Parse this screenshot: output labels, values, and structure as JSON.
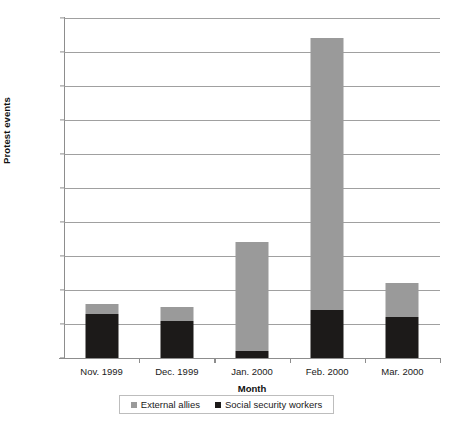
{
  "chart_data": {
    "type": "bar",
    "subtype": "stacked-vertical",
    "title": "",
    "xlabel": "Month",
    "ylabel": "Protest events",
    "categories": [
      "Nov. 1999",
      "Dec. 1999",
      "Jan. 2000",
      "Feb. 2000",
      "Mar. 2000"
    ],
    "series": [
      {
        "name": "Social security workers",
        "color": "#1c1a19",
        "values": [
          13,
          11,
          2,
          14,
          12
        ]
      },
      {
        "name": "External allies",
        "color": "#9a9a9a",
        "values": [
          3,
          4,
          32,
          80,
          10
        ]
      }
    ],
    "totals": [
      16,
      15,
      34,
      94,
      22
    ],
    "ylim": [
      0,
      100
    ],
    "ytick_labels": [
      "0",
      "10",
      "20",
      "30",
      "40",
      "50",
      "60",
      "70",
      "80",
      "90",
      "100"
    ],
    "ytick_values": [
      0,
      10,
      20,
      30,
      40,
      50,
      60,
      70,
      80,
      90,
      100
    ],
    "grid": "horizontal",
    "legend_position": "bottom",
    "legend_entries": [
      {
        "label": "External allies",
        "swatch": "#9a9a9a"
      },
      {
        "label": "Social security workers",
        "swatch": "#1c1a19"
      }
    ],
    "axis_color": "#8d8d8d",
    "grid_color": "#a0a0a0",
    "background": "#ffffff"
  }
}
